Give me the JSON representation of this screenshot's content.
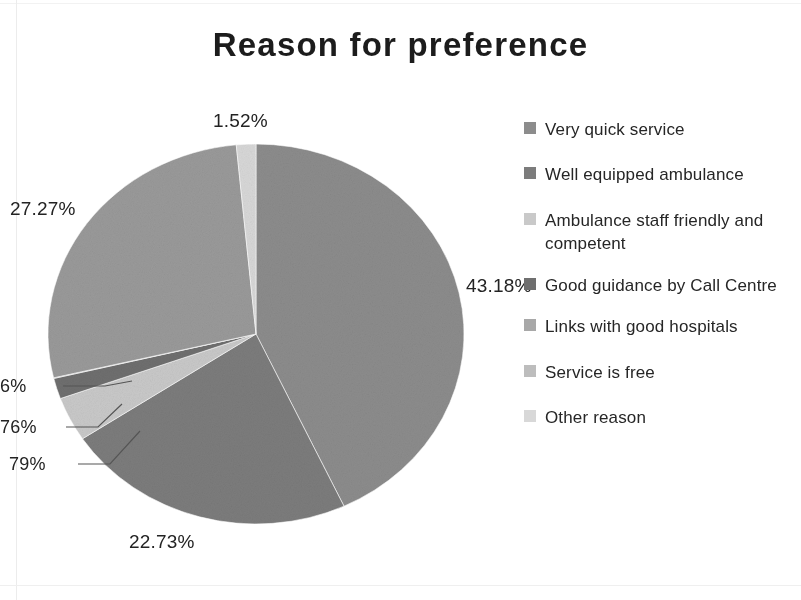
{
  "chart_data": {
    "type": "pie",
    "title": "Reason for preference",
    "categories": [
      "Very quick service",
      "Well equipped ambulance",
      "Ambulance staff friendly and competent",
      "Good guidance by Call Centre",
      "Links with good hospitals",
      "Service is free",
      "Other reason"
    ],
    "values": [
      43.18,
      22.73,
      3.79,
      1.76,
      0.06,
      27.27,
      1.52
    ],
    "data_labels": [
      "43.18%",
      "22.73%",
      "79%",
      "76%",
      "6%",
      "27.27%",
      "1.52%"
    ],
    "colors": [
      "#8c8c8c",
      "#7c7c7c",
      "#c9c9c9",
      "#6f6f6f",
      "#a8a8a8",
      "#9a9a9a",
      "#d8d8d8"
    ],
    "legend_position": "right",
    "grid": false,
    "xlabel": "",
    "ylabel": ""
  },
  "title": {
    "text": "Reason for preference"
  },
  "labels": {
    "top": "1.52%",
    "right": "43.18%",
    "bottom": "22.73%",
    "upper_left": "27.27%",
    "left_a": "6%",
    "left_b": "76%",
    "left_c": "79%"
  },
  "legend": {
    "items": [
      {
        "label": "Very quick service",
        "color": "#8c8c8c"
      },
      {
        "label": "Well equipped ambulance",
        "color": "#7c7c7c"
      },
      {
        "label": "Ambulance staff friendly and competent",
        "color": "#c9c9c9"
      },
      {
        "label": "Good guidance by Call Centre",
        "color": "#6f6f6f"
      },
      {
        "label": "Links with good hospitals",
        "color": "#a8a8a8"
      },
      {
        "label": "Service is free",
        "color": "#bdbdbd"
      },
      {
        "label": "Other reason",
        "color": "#d8d8d8"
      }
    ]
  }
}
